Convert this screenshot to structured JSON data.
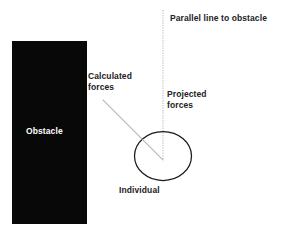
{
  "figure": {
    "title": "Parallel line to obstacle",
    "background_color": "#ffffff",
    "labels": {
      "parallel_line": "Parallel line to obstacle",
      "calculated_forces_line1": "Calculated",
      "calculated_forces_line2": "forces",
      "projected_forces_line1": "Projected",
      "projected_forces_line2": "forces",
      "individual": "Individual",
      "obstacle": "Obstacle"
    },
    "colors": {
      "obstacle_fill": "#080808",
      "obstacle_label_text": "#ffffff",
      "label_text": "#222222",
      "circle_stroke": "#1a1a1a",
      "parallel_line_stroke": "#b0b0b0",
      "force_arrow_stroke": "#a8a8a8"
    },
    "shapes": {
      "obstacle_rect": {
        "x": 12,
        "y": 41,
        "width": 75,
        "height": 183
      },
      "individual_circle": {
        "cx": 163,
        "cy": 156,
        "rx": 28,
        "ry": 24
      },
      "parallel_line": {
        "x": 163,
        "y_top": 10,
        "y_bottom": 160
      },
      "calculated_forces_arrow": {
        "x1": 103,
        "y1": 100,
        "x2": 163,
        "y2": 160
      }
    }
  }
}
